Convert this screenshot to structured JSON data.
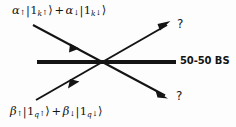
{
  "figure": {
    "background_color": "#fdfdfd",
    "ink_color": "#141414"
  },
  "inputs": {
    "top": {
      "full_text": "α↑|1k↑⟩ + α↓|1k↓⟩",
      "amp1_symbol": "α",
      "amp1_spin": "↑",
      "ket1_number": "1",
      "ket1_mode": "k",
      "ket1_spin": "↑",
      "operator": "+",
      "amp2_symbol": "α",
      "amp2_spin": "↓",
      "ket2_number": "1",
      "ket2_mode": "k",
      "ket2_spin": "↓",
      "ket_open": "|",
      "ket_close": "⟩"
    },
    "bottom": {
      "full_text": "β↑|1q↑⟩ + β↓|1q↓⟩",
      "amp1_symbol": "β",
      "amp1_spin": "↑",
      "ket1_number": "1",
      "ket1_mode": "q",
      "ket1_spin": "↑",
      "operator": "+",
      "amp2_symbol": "β",
      "amp2_spin": "↓",
      "ket2_number": "1",
      "ket2_mode": "q",
      "ket2_spin": "↓",
      "ket_open": "|",
      "ket_close": "⟩"
    }
  },
  "component": {
    "label": "50-50 BS"
  },
  "outputs": {
    "top": {
      "label": "?"
    },
    "bottom": {
      "label": "?"
    }
  },
  "geometry": {
    "crossing_point": {
      "x": 107,
      "y": 62
    },
    "beamsplitter_line": {
      "x1": 37,
      "y1": 62,
      "x2": 176,
      "y2": 62,
      "width": 4
    },
    "input_top_ray": {
      "x1": 33,
      "y1": 25,
      "x2": 165,
      "y2": 97,
      "width": 2
    },
    "input_bottom_ray": {
      "x1": 36,
      "y1": 100,
      "x2": 168,
      "y2": 23,
      "width": 2
    },
    "midpoint_arrow_top": {
      "x": 73,
      "y": 47
    },
    "midpoint_arrow_bottom": {
      "x": 72,
      "y": 85
    },
    "tip_arrow_upper_right": {
      "x": 168,
      "y": 23
    },
    "tip_arrow_lower_right": {
      "x": 165,
      "y": 97
    }
  }
}
